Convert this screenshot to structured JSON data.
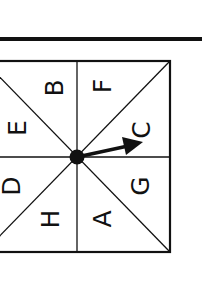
{
  "diagram": {
    "type": "spinner",
    "sections": [
      {
        "label": "B",
        "x": 55,
        "y": 88
      },
      {
        "label": "E",
        "x": 18,
        "y": 128
      },
      {
        "label": "D",
        "x": 12,
        "y": 186
      },
      {
        "label": "H",
        "x": 51,
        "y": 219
      },
      {
        "label": "F",
        "x": 103,
        "y": 86
      },
      {
        "label": "C",
        "x": 142,
        "y": 130
      },
      {
        "label": "G",
        "x": 141,
        "y": 186
      },
      {
        "label": "A",
        "x": 103,
        "y": 219
      }
    ],
    "arrow_points_to": "C",
    "line_color": "#111111"
  }
}
